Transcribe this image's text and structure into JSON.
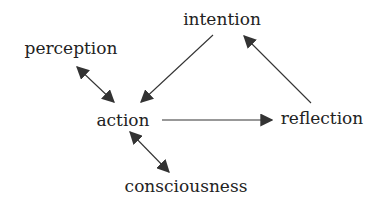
{
  "diagram": {
    "type": "concept-map",
    "colors": {
      "text": "#222222",
      "line": "#333333",
      "background": "#ffffff"
    },
    "nodes": {
      "intention": "intention",
      "perception": "perception",
      "action": "action",
      "reflection": "reflection",
      "consciousness": "consciousness"
    },
    "edges": [
      {
        "from": "intention",
        "to": "action",
        "direction": "forward"
      },
      {
        "from": "action",
        "to": "reflection",
        "direction": "forward"
      },
      {
        "from": "reflection",
        "to": "intention",
        "direction": "forward"
      },
      {
        "from": "perception",
        "to": "action",
        "direction": "bidirectional"
      },
      {
        "from": "action",
        "to": "consciousness",
        "direction": "bidirectional"
      }
    ]
  }
}
